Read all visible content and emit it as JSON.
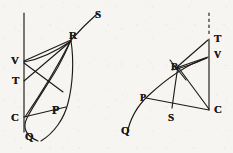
{
  "page": {
    "background_color": "#f7f5f1",
    "ink_color": "#1d1b19",
    "width": 233,
    "height": 153
  },
  "figures": [
    {
      "id": "left-figure",
      "name": "left-diagram",
      "description": "Vertical axis line with points V, T, C; curve through Q, P rising to R and continuing to S; straight rays from V and T converging at R; chord from C to P region.",
      "labels": [
        {
          "key": "S",
          "text": "S",
          "x": 95,
          "y": 9,
          "size": 11
        },
        {
          "key": "R",
          "text": "R",
          "x": 69,
          "y": 30,
          "size": 11
        },
        {
          "key": "V",
          "text": "V",
          "x": 11,
          "y": 55,
          "size": 11
        },
        {
          "key": "T",
          "text": "T",
          "x": 12,
          "y": 75,
          "size": 11
        },
        {
          "key": "P",
          "text": "P",
          "x": 52,
          "y": 104,
          "size": 11
        },
        {
          "key": "C",
          "text": "C",
          "x": 11,
          "y": 112,
          "size": 11
        },
        {
          "key": "Q",
          "text": "Q",
          "x": 25,
          "y": 131,
          "size": 11
        }
      ],
      "points": {
        "V": {
          "x": 24,
          "y": 61
        },
        "T": {
          "x": 24,
          "y": 81
        },
        "C": {
          "x": 24,
          "y": 117
        },
        "Q": {
          "x": 38,
          "y": 140
        },
        "P": {
          "x": 49,
          "y": 116
        },
        "R": {
          "x": 71,
          "y": 40
        },
        "S": {
          "x": 96,
          "y": 16
        }
      },
      "axis": {
        "label": "vertical-axis",
        "x": 24,
        "y1": 13,
        "y2": 132
      }
    },
    {
      "id": "right-figure",
      "name": "right-diagram",
      "description": "Arc from Q through P and R up toward T/V; vertical line from C up through V to T with dashed extension above T; straight segments C-R, C-P, C-V and arc R-S.",
      "labels": [
        {
          "key": "T",
          "text": "T",
          "x": 214,
          "y": 33,
          "size": 11
        },
        {
          "key": "V",
          "text": "V",
          "x": 214,
          "y": 50,
          "size": 11
        },
        {
          "key": "R",
          "text": "R",
          "x": 171,
          "y": 62,
          "size": 11
        },
        {
          "key": "P",
          "text": "P",
          "x": 140,
          "y": 93,
          "size": 11
        },
        {
          "key": "C",
          "text": "C",
          "x": 214,
          "y": 104,
          "size": 11
        },
        {
          "key": "S",
          "text": "S",
          "x": 168,
          "y": 112,
          "size": 11
        },
        {
          "key": "Q",
          "text": "Q",
          "x": 121,
          "y": 125,
          "size": 11
        }
      ],
      "points": {
        "T": {
          "x": 209,
          "y": 40
        },
        "V": {
          "x": 209,
          "y": 57
        },
        "R": {
          "x": 179,
          "y": 68
        },
        "P": {
          "x": 145,
          "y": 99
        },
        "C": {
          "x": 209,
          "y": 110
        },
        "S": {
          "x": 172,
          "y": 107
        },
        "Q": {
          "x": 127,
          "y": 133
        }
      },
      "dashed_extension": {
        "label": "dashed-vertical-above-T",
        "x": 209,
        "y1": 13,
        "y2": 36
      }
    }
  ],
  "stroke": {
    "width": 1.15,
    "color": "#1d1b19"
  }
}
